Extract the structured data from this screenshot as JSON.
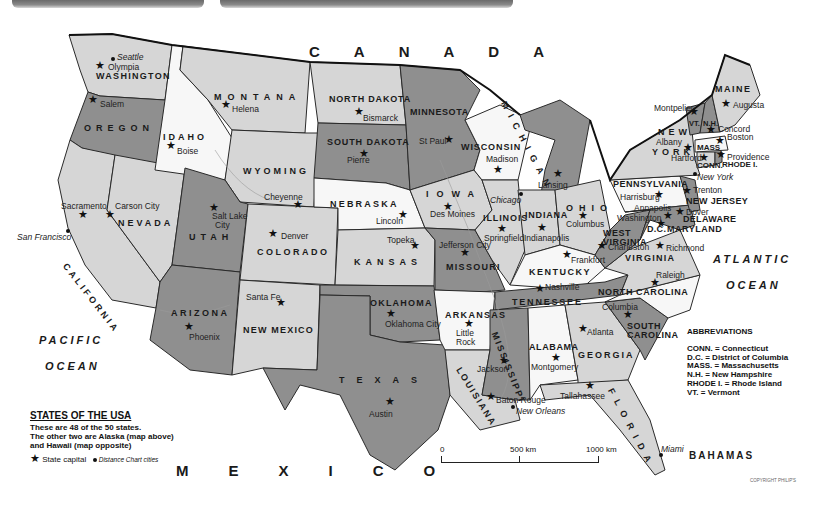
{
  "map": {
    "title": "STATES OF THE USA",
    "description_lines": [
      "These are 48 of the 50 states.",
      "The other two are Alaska (map above)",
      "and Hawaii (map opposite)"
    ],
    "legend": {
      "capital_label": "State capital",
      "city_label": "Distance Chart cities",
      "capital_icon": "star-icon",
      "city_icon": "dot-icon"
    },
    "colors": {
      "light": "#d6d6d6",
      "white": "#f7f7f7",
      "dark": "#8f8f8f",
      "border": "#2a2a2a",
      "water": "#ffffff"
    },
    "countries": {
      "canada": "CANADA",
      "mexico": "MEXICO",
      "bahamas": "BAHAMAS"
    },
    "oceans": {
      "pacific_1": "PACIFIC",
      "pacific_2": "OCEAN",
      "atlantic_1": "ATLANTIC",
      "atlantic_2": "OCEAN"
    },
    "states": {
      "washington": "WASHINGTON",
      "oregon": "OREGON",
      "california": "CALIFORNIA",
      "idaho": "IDAHO",
      "nevada": "NEVADA",
      "montana": "MONTANA",
      "wyoming": "WYOMING",
      "utah": "UTAH",
      "arizona": "ARIZONA",
      "colorado": "COLORADO",
      "new_mexico": "NEW MEXICO",
      "north_dakota": "NORTH DAKOTA",
      "south_dakota": "SOUTH DAKOTA",
      "nebraska": "NEBRASKA",
      "kansas": "KANSAS",
      "oklahoma": "OKLAHOMA",
      "texas": "TEXAS",
      "minnesota": "MINNESOTA",
      "iowa": "IOWA",
      "missouri": "MISSOURI",
      "arkansas": "ARKANSAS",
      "louisiana": "LOUISIANA",
      "wisconsin": "WISCONSIN",
      "illinois": "ILLINOIS",
      "michigan": "MICHIGAN",
      "indiana": "INDIANA",
      "ohio": "OHIO",
      "kentucky": "KENTUCKY",
      "tennessee": "TENNESSEE",
      "mississippi": "MISSISSIPPI",
      "alabama": "ALABAMA",
      "georgia": "GEORGIA",
      "florida": "FLORIDA",
      "south_carolina_1": "SOUTH",
      "south_carolina_2": "CAROLINA",
      "north_carolina": "NORTH CAROLINA",
      "virginia": "VIRGINIA",
      "west_virginia_1": "WEST",
      "west_virginia_2": "VIRGINIA",
      "pennsylvania": "PENNSYLVANIA",
      "new_york_1": "NEW",
      "new_york_2": "YORK",
      "new_jersey": "NEW JERSEY",
      "delaware": "DELAWARE",
      "maryland": "MARYLAND",
      "dc": "D.C.",
      "conn": "CONN.",
      "mass": "MASS",
      "rhode": "RHODE I.",
      "vt": "VT.",
      "nh": "N.H.",
      "maine": "MAINE"
    },
    "capitals": {
      "olympia": "Olympia",
      "salem": "Salem",
      "sacramento": "Sacramento",
      "boise": "Boise",
      "carson": "Carson City",
      "helena": "Helena",
      "cheyenne": "Cheyenne",
      "salt_lake_1": "Salt Lake",
      "salt_lake_2": "City",
      "phoenix": "Phoenix",
      "denver": "Denver",
      "santa_fe": "Santa Fe",
      "bismarck": "Bismarck",
      "pierre": "Pierre",
      "lincoln": "Lincoln",
      "topeka": "Topeka",
      "oklahoma_city": "Oklahoma City",
      "austin": "Austin",
      "st_paul": "St Paul",
      "des_moines": "Des Moines",
      "jefferson": "Jefferson City",
      "little_rock_1": "Little",
      "little_rock_2": "Rock",
      "baton_rouge": "Baton Rouge",
      "madison": "Madison",
      "springfield": "Springfield",
      "lansing": "Lansing",
      "indianapolis": "Indianapolis",
      "columbus": "Columbus",
      "frankfort": "Frankfort",
      "nashville": "Nashville",
      "jackson": "Jackson",
      "montgomery": "Montgomery",
      "atlanta": "Atlanta",
      "tallahassee": "Tallahassee",
      "columbia": "Columbia",
      "raleigh": "Raleigh",
      "richmond": "Richmond",
      "charleston": "Charleston",
      "harrisburg": "Harrisburg",
      "annapolis": "Annapolis",
      "washington": "Washington",
      "dover": "Dover",
      "trenton": "Trenton",
      "albany": "Albany",
      "hartford": "Hartford",
      "providence": "Providence",
      "boston": "Boston",
      "concord": "Concord",
      "montpelier": "Montpelier",
      "augusta": "Augusta"
    },
    "cities": {
      "seattle": "Seattle",
      "san_francisco": "San Francisco",
      "chicago": "Chicago",
      "new_york": "New York",
      "new_orleans": "New Orleans",
      "miami": "Miami"
    },
    "abbreviations": {
      "title": "ABBREVIATIONS",
      "items": [
        "CONN. = Connecticut",
        "D.C. = District of Columbia",
        "MASS. = Massachusetts",
        "N.H. = New Hampshire",
        "RHODE I. = Rhode Island",
        "VT. = Vermont"
      ]
    },
    "scale_bar": {
      "ticks": [
        "0",
        "500 km",
        "1000 km"
      ]
    },
    "copyright": "COPYRIGHT PHILIP'S"
  }
}
